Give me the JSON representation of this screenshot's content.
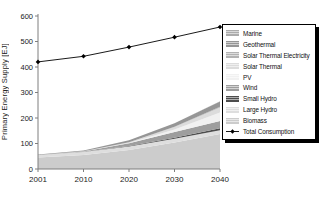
{
  "figure": {
    "background": "#ffffff",
    "axis_color": "#7f7f7f",
    "text_color": "#1a1a1a"
  },
  "chart_data": {
    "type": "area",
    "stacked": true,
    "title": "",
    "xlabel": "",
    "ylabel": "Primary Energy Supply [EJ]",
    "ylim": [
      0,
      600
    ],
    "y_ticks": [
      "0",
      "100",
      "200",
      "300",
      "400",
      "500",
      "600"
    ],
    "categories": [
      "2001",
      "2010",
      "2020",
      "2030",
      "2040"
    ],
    "grid": false,
    "legend_position": "right",
    "legend_order": [
      "Marine",
      "Geothermal",
      "Solar Thermal Electricity",
      "Solar Thermal",
      "PV",
      "Wind",
      "Small Hydro",
      "Large Hydro",
      "Biomass",
      "Total Consumption"
    ],
    "series": [
      {
        "name": "Biomass",
        "color": "#cccccc",
        "values": [
          45.2,
          55.0,
          75.0,
          104.0,
          137.0
        ]
      },
      {
        "name": "Large Hydro",
        "color": "#dedede",
        "values": [
          9.3,
          11.1,
          12.9,
          14.3,
          15.0
        ]
      },
      {
        "name": "Small Hydro",
        "color": "#4d4d4d",
        "values": [
          0.4,
          0.8,
          2.1,
          4.4,
          7.9
        ]
      },
      {
        "name": "Wind",
        "color": "#9e9e9e",
        "values": [
          0.2,
          1.8,
          11.1,
          22.7,
          28.8
        ]
      },
      {
        "name": "PV",
        "color": "#f1f1f1",
        "values": [
          0.0,
          0.1,
          1.0,
          9.3,
          32.8
        ]
      },
      {
        "name": "Solar Thermal",
        "color": "#dcdcdc",
        "values": [
          0.2,
          0.6,
          2.8,
          10.2,
          20.1
        ]
      },
      {
        "name": "Solar Thermal Electricity",
        "color": "#b3b3b3",
        "values": [
          0.0,
          0.0,
          0.1,
          0.7,
          2.8
        ]
      },
      {
        "name": "Geothermal",
        "color": "#969696",
        "values": [
          1.8,
          3.6,
          7.8,
          13.9,
          20.6
        ]
      },
      {
        "name": "Marine",
        "color": "#ababab",
        "values": [
          0.0,
          0.0,
          0.0,
          0.1,
          0.8
        ]
      }
    ],
    "line_series": {
      "name": "Total Consumption",
      "color": "#000000",
      "marker": "diamond",
      "values": [
        420,
        442,
        478,
        517,
        557
      ]
    }
  }
}
